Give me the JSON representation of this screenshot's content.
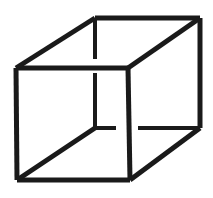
{
  "figure": {
    "type": "line-drawing",
    "canvas": {
      "width": 213,
      "height": 198,
      "background_color": "#ffffff"
    },
    "style": {
      "stroke_color": "#1a1a1a",
      "stroke_width": 5,
      "stroke_width_thin": 4
    },
    "vertices": {
      "front_top_left": [
        16,
        68
      ],
      "front_top_right": [
        128,
        68
      ],
      "front_bottom_right": [
        130,
        180
      ],
      "front_bottom_left": [
        17,
        180
      ],
      "back_top_left": [
        95,
        18
      ],
      "back_top_right": [
        200,
        18
      ],
      "back_bottom_right": [
        200,
        128
      ],
      "back_bottom_left": [
        95,
        128
      ]
    },
    "edges": [
      {
        "name": "front-top",
        "from": [
          16,
          68
        ],
        "to": [
          128,
          68
        ],
        "occluded": false
      },
      {
        "name": "front-right",
        "from": [
          128,
          68
        ],
        "to": [
          130,
          180
        ],
        "occluded": false
      },
      {
        "name": "front-bottom",
        "from": [
          130,
          180
        ],
        "to": [
          17,
          180
        ],
        "occluded": false
      },
      {
        "name": "front-left",
        "from": [
          17,
          180
        ],
        "to": [
          16,
          68
        ],
        "occluded": false
      },
      {
        "name": "back-top",
        "from": [
          95,
          18
        ],
        "to": [
          200,
          18
        ],
        "occluded": false
      },
      {
        "name": "back-right",
        "from": [
          200,
          18
        ],
        "to": [
          200,
          128
        ],
        "occluded": false
      },
      {
        "name": "connector-top-left",
        "from": [
          16,
          68
        ],
        "to": [
          95,
          18
        ],
        "occluded": false
      },
      {
        "name": "connector-top-right",
        "from": [
          128,
          68
        ],
        "to": [
          200,
          18
        ],
        "occluded": false
      },
      {
        "name": "connector-bottom-right",
        "from": [
          130,
          180
        ],
        "to": [
          200,
          128
        ],
        "occluded": false
      },
      {
        "name": "connector-bottom-left",
        "from": [
          17,
          180
        ],
        "to": [
          95,
          128
        ],
        "occluded": false
      }
    ],
    "broken_edges": [
      {
        "name": "back-left-vertical",
        "from": [
          95,
          18
        ],
        "to": [
          95,
          128
        ],
        "gap_from": [
          95,
          59
        ],
        "gap_to": [
          95,
          73
        ],
        "reason": "crossed by nearer front-top edge"
      },
      {
        "name": "back-bottom-horizontal",
        "from": [
          95,
          128
        ],
        "to": [
          200,
          128
        ],
        "gap_from": [
          116,
          128
        ],
        "gap_to": [
          138,
          128
        ],
        "reason": "crossed by nearer front-right edge"
      }
    ]
  }
}
